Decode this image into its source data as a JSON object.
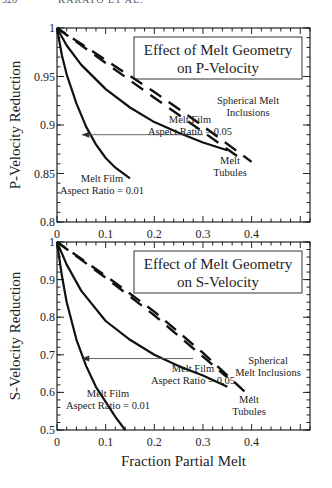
{
  "page_header": {
    "page_number": "326",
    "running_title": "KARATO ET AL."
  },
  "chart_data": [
    {
      "type": "line",
      "title": "Effect of Melt Geometry on P-Velocity",
      "title_lines": [
        "Effect of Melt Geometry",
        "on P-Velocity"
      ],
      "xlabel": "",
      "ylabel": "P-Velocity Reduction",
      "xlim": [
        0,
        0.5
      ],
      "ylim": [
        0.8,
        1.0
      ],
      "xticks": [
        "0",
        "0.1",
        "0.2",
        "0.3",
        "0.4"
      ],
      "yticks": [
        "0.8",
        "0.85",
        "0.9",
        "0.95",
        "1"
      ],
      "grid": false,
      "series": [
        {
          "name": "Melt Film Aspect Ratio = 0.01",
          "style": "solid",
          "x": [
            0,
            0.01,
            0.02,
            0.04,
            0.06,
            0.08,
            0.1,
            0.12,
            0.15
          ],
          "y": [
            1.0,
            0.972,
            0.952,
            0.922,
            0.898,
            0.88,
            0.866,
            0.856,
            0.845
          ]
        },
        {
          "name": "Melt Film Aspect Ratio = 0.05",
          "style": "solid",
          "x": [
            0,
            0.02,
            0.05,
            0.1,
            0.15,
            0.2,
            0.25,
            0.3,
            0.35
          ],
          "y": [
            1.0,
            0.982,
            0.962,
            0.937,
            0.918,
            0.903,
            0.892,
            0.882,
            0.874
          ]
        },
        {
          "name": "Spherical Melt Inclusions",
          "style": "dashed",
          "x": [
            0,
            0.1,
            0.2,
            0.3,
            0.37
          ],
          "y": [
            1.0,
            0.964,
            0.928,
            0.893,
            0.868
          ]
        },
        {
          "name": "Melt Tubules",
          "style": "dashed",
          "x": [
            0,
            0.1,
            0.2,
            0.3,
            0.4
          ],
          "y": [
            1.0,
            0.967,
            0.934,
            0.899,
            0.862
          ]
        }
      ],
      "annotations": [
        {
          "text": "Melt Film",
          "text2": "Aspect Ratio = 0.05"
        },
        {
          "text": "Melt Film",
          "text2": "Aspect Ratio = 0.01"
        },
        {
          "text": "Spherical Melt",
          "text2": "Inclusions"
        },
        {
          "text": "Melt",
          "text2": "Tubules"
        }
      ],
      "arrow": {
        "from_x": 0.3,
        "to_x": 0.05,
        "y": 0.89
      }
    },
    {
      "type": "line",
      "title": "Effect of Melt Geometry on S-Velocity",
      "title_lines": [
        "Effect of Melt Geometry",
        "on S-Velocity"
      ],
      "xlabel": "Fraction Partial Melt",
      "ylabel": "S-Velocity Reduction",
      "xlim": [
        0,
        0.5
      ],
      "ylim": [
        0.5,
        1.0
      ],
      "xticks": [
        "0",
        "0.1",
        "0.2",
        "0.3",
        "0.4"
      ],
      "yticks": [
        "0.5",
        "0.6",
        "0.7",
        "0.8",
        "0.9",
        "1"
      ],
      "grid": false,
      "series": [
        {
          "name": "Melt Film Aspect Ratio = 0.01",
          "style": "solid",
          "x": [
            0,
            0.01,
            0.02,
            0.04,
            0.06,
            0.08,
            0.1,
            0.12,
            0.14
          ],
          "y": [
            1.0,
            0.91,
            0.84,
            0.74,
            0.67,
            0.615,
            0.575,
            0.535,
            0.5
          ]
        },
        {
          "name": "Melt Film Aspect Ratio = 0.05",
          "style": "solid",
          "x": [
            0,
            0.02,
            0.05,
            0.1,
            0.15,
            0.2,
            0.25,
            0.3,
            0.35
          ],
          "y": [
            1.0,
            0.94,
            0.87,
            0.79,
            0.74,
            0.7,
            0.67,
            0.645,
            0.615
          ]
        },
        {
          "name": "Spherical Melt Inclusions",
          "style": "dashed",
          "x": [
            0,
            0.1,
            0.2,
            0.3,
            0.35
          ],
          "y": [
            1.0,
            0.905,
            0.805,
            0.695,
            0.64
          ]
        },
        {
          "name": "Melt Tubules",
          "style": "dashed",
          "x": [
            0,
            0.1,
            0.2,
            0.3,
            0.4
          ],
          "y": [
            1.0,
            0.91,
            0.815,
            0.705,
            0.585
          ]
        }
      ],
      "annotations": [
        {
          "text": "Melt Film",
          "text2": "Aspect Ratio = 0.05"
        },
        {
          "text": "Melt Film",
          "text2": "Aspect Ratio = 0.01"
        },
        {
          "text": "Spherical",
          "text2": "Melt Inclusions"
        },
        {
          "text": "Melt",
          "text2": "Tubules"
        }
      ],
      "arrow": {
        "from_x": 0.28,
        "to_x": 0.05,
        "y": 0.69
      }
    }
  ]
}
